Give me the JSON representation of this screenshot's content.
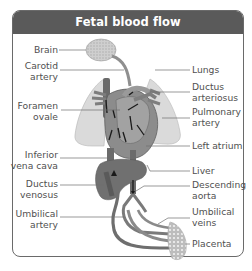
{
  "title": "Fetal blood flow",
  "colors": {
    "title_bar": "#5a5a5a",
    "title_text": "#ffffff",
    "frame_border": "#6a6a6a",
    "label_text": "#505050",
    "leader_line": "#6e6e6e",
    "lung_fill": "#d9d9d9",
    "heart_fill": "#8a8a8a",
    "vessel_fill": "#7a7a7a",
    "liver_fill": "#6f6f6f",
    "brain_fill": "#c8c8c8",
    "placenta_fill": "#c4c4c4",
    "arrow": "#1a1a1a"
  },
  "labels_left": [
    {
      "id": "brain",
      "text": "Brain"
    },
    {
      "id": "carotid-artery",
      "text": "Carotid\nartery"
    },
    {
      "id": "foramen-ovale",
      "text": "Foramen\novale"
    },
    {
      "id": "inferior-vena-cava",
      "text": "Inferior\nvena cava"
    },
    {
      "id": "ductus-venosus",
      "text": "Ductus\nvenosus"
    },
    {
      "id": "umbilical-artery",
      "text": "Umbilical\nartery"
    }
  ],
  "labels_right": [
    {
      "id": "lungs",
      "text": "Lungs"
    },
    {
      "id": "ductus-arteriosus",
      "text": "Ductus\narteriosus"
    },
    {
      "id": "pulmonary-artery",
      "text": "Pulmonary\nartery"
    },
    {
      "id": "left-atrium",
      "text": "Left atrium"
    },
    {
      "id": "liver",
      "text": "Liver"
    },
    {
      "id": "descending-aorta",
      "text": "Descending\naorta"
    },
    {
      "id": "umbilical-veins",
      "text": "Umbilical\nveins"
    },
    {
      "id": "placenta",
      "text": "Placenta"
    }
  ],
  "text": {
    "brain": "Brain",
    "carotid_1": "Carotid",
    "carotid_2": "artery",
    "foramen_1": "Foramen",
    "foramen_2": "ovale",
    "ivc_1": "Inferior",
    "ivc_2": "vena cava",
    "dv_1": "Ductus",
    "dv_2": "venosus",
    "ua_1": "Umbilical",
    "ua_2": "artery",
    "lungs": "Lungs",
    "da_1": "Ductus",
    "da_2": "arteriosus",
    "pa_1": "Pulmonary",
    "pa_2": "artery",
    "left_atrium": "Left atrium",
    "liver": "Liver",
    "desc_1": "Descending",
    "desc_2": "aorta",
    "uv_1": "Umbilical",
    "uv_2": "veins",
    "placenta": "Placenta"
  }
}
